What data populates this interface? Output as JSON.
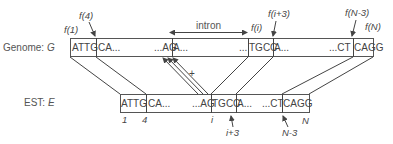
{
  "genome": {
    "label": "Genome: ",
    "var": "G",
    "segments": [
      "ATTG",
      "CA...",
      "...AG",
      "A...",
      "...",
      "TGCC",
      "A...",
      "...CT",
      "CAGG"
    ],
    "markers": [
      "f(1)",
      "f(4)",
      "f(i)",
      "f(i+3)",
      "f(N-3)",
      "f(N)"
    ],
    "intron_label": "intron"
  },
  "est": {
    "label": "EST: ",
    "var": "E",
    "segments": [
      "ATTG",
      "CA...",
      "...AG",
      "TGCC",
      "A...",
      "...CT",
      "CAGG"
    ],
    "positions": [
      "1",
      "4",
      "i",
      "i+3",
      "N-3",
      "N"
    ]
  },
  "mismatch_mark": "+"
}
